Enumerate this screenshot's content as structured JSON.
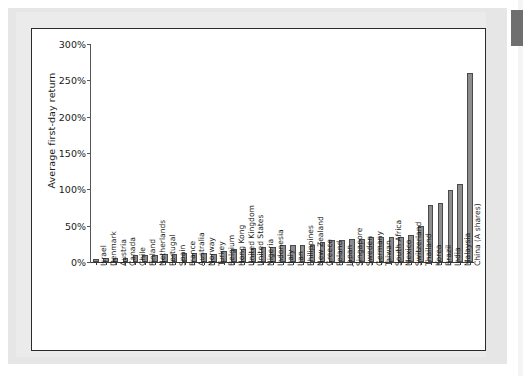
{
  "figure": {
    "y_axis_title": "Average first-day return",
    "y_tick_labels": [
      "0%",
      "50%",
      "100%",
      "150%",
      "200%",
      "250%",
      "300%"
    ],
    "bar_color": "#8d8d8d",
    "bar_edge_color": "#4a4a4a",
    "frame_color": "#2b2b2b",
    "background_color": "#ffffff"
  },
  "chart_data": {
    "type": "bar",
    "title": "",
    "xlabel": "",
    "ylabel": "Average first-day return",
    "ylim": [
      0,
      300
    ],
    "yticks": [
      0,
      50,
      100,
      150,
      200,
      250,
      300
    ],
    "ytick_labels": [
      "0%",
      "50%",
      "100%",
      "150%",
      "200%",
      "250%",
      "300%"
    ],
    "grid": false,
    "legend": "none",
    "units": "percent",
    "categories": [
      "Israel",
      "Denmark",
      "Austria",
      "Canada",
      "Chile",
      "Finland",
      "Netherlands",
      "Portugal",
      "Spain",
      "France",
      "Australia",
      "Norway",
      "Turkey",
      "Belgium",
      "Hong Kong",
      "United Kingdom",
      "United States",
      "Nigeria",
      "Indonesia",
      "Italy",
      "Iran",
      "Philippines",
      "New Zealand",
      "Greece",
      "Poland",
      "Japan",
      "Singapore",
      "Sweden",
      "Germany",
      "Taiwan",
      "South Africa",
      "Mexico",
      "Switzerland",
      "Thailand",
      "Korea",
      "Brazil",
      "India",
      "Malaysia",
      "China (A shares)"
    ],
    "values": [
      4,
      5,
      6,
      6,
      9,
      10,
      10,
      11,
      11,
      13,
      13,
      12,
      11,
      15,
      18,
      18,
      19,
      21,
      21,
      23,
      23,
      24,
      24,
      27,
      30,
      30,
      31,
      32,
      34,
      34,
      35,
      35,
      37,
      50,
      78,
      81,
      99,
      107,
      260
    ],
    "series": [
      {
        "name": "Average first-day return",
        "values": [
          4,
          5,
          6,
          6,
          9,
          10,
          10,
          11,
          11,
          13,
          13,
          12,
          11,
          15,
          18,
          18,
          19,
          21,
          21,
          23,
          23,
          24,
          24,
          27,
          30,
          30,
          31,
          32,
          34,
          34,
          35,
          35,
          37,
          50,
          78,
          81,
          99,
          107,
          260
        ]
      }
    ]
  }
}
